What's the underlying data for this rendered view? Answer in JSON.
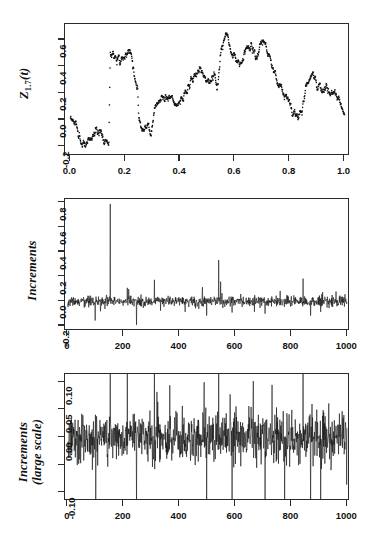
{
  "figure": {
    "background": "#ffffff",
    "ink": "#2b2b2b",
    "panel_count": 3
  },
  "chart_data": [
    {
      "type": "scatter",
      "panel": 1,
      "title": "",
      "xlabel": "",
      "ylabel": "Z_{1.7}(t)",
      "ylabel_parts": {
        "base": "Z",
        "subscript": "1.7",
        "arg": "(t)"
      },
      "xlim": [
        -0.02,
        1.02
      ],
      "ylim": [
        -0.27,
        0.72
      ],
      "xticks": [
        0.0,
        0.2,
        0.4,
        0.6,
        0.8,
        1.0
      ],
      "xticklabels": [
        "0.0",
        "0.2",
        "0.4",
        "0.6",
        "0.8",
        "1.0"
      ],
      "yticks": [
        -0.2,
        0.0,
        0.2,
        0.4,
        0.6
      ],
      "yticklabels": [
        "-0.2",
        "0.0",
        "0.2",
        "0.4",
        "0.6"
      ],
      "grid": false,
      "legend": null,
      "marker": "point",
      "marker_color": "#111111",
      "marker_size": 1.3,
      "n_points": 1000,
      "description": "Sample path of a 1.7-stable Levy-driven process Z_{1.7}(t) on t in [0,1]; rough jump-diffusion trajectory with visible upward jumps near t=0.15 and t=0.53 and a downward drift after t=0.72.",
      "path_anchors": {
        "t": [
          0.0,
          0.02,
          0.04,
          0.06,
          0.08,
          0.1,
          0.12,
          0.14,
          0.145,
          0.16,
          0.18,
          0.2,
          0.22,
          0.235,
          0.245,
          0.25,
          0.27,
          0.29,
          0.305,
          0.32,
          0.34,
          0.36,
          0.38,
          0.4,
          0.42,
          0.44,
          0.46,
          0.47,
          0.49,
          0.51,
          0.525,
          0.535,
          0.55,
          0.57,
          0.59,
          0.6,
          0.62,
          0.64,
          0.66,
          0.68,
          0.695,
          0.71,
          0.73,
          0.75,
          0.77,
          0.79,
          0.81,
          0.83,
          0.845,
          0.86,
          0.88,
          0.9,
          0.92,
          0.94,
          0.96,
          0.98,
          1.0
        ],
        "z": [
          0.02,
          -0.04,
          -0.17,
          -0.19,
          -0.15,
          -0.06,
          -0.11,
          -0.22,
          0.45,
          0.47,
          0.44,
          0.5,
          0.52,
          0.3,
          0.25,
          -0.02,
          -0.07,
          -0.1,
          0.02,
          0.14,
          0.18,
          0.14,
          0.16,
          0.12,
          0.23,
          0.32,
          0.39,
          0.41,
          0.33,
          0.3,
          0.37,
          0.25,
          0.53,
          0.63,
          0.55,
          0.5,
          0.41,
          0.52,
          0.55,
          0.46,
          0.6,
          0.56,
          0.42,
          0.29,
          0.24,
          0.17,
          0.11,
          0.02,
          0.08,
          0.22,
          0.35,
          0.26,
          0.19,
          0.24,
          0.22,
          0.13,
          0.01
        ]
      }
    },
    {
      "type": "line",
      "panel": 2,
      "title": "",
      "xlabel": "",
      "ylabel": "Increments",
      "xlim": [
        -10,
        1010
      ],
      "ylim": [
        -0.24,
        0.83
      ],
      "xticks": [
        0,
        200,
        400,
        600,
        800,
        1000
      ],
      "xticklabels": [
        "0",
        "200",
        "400",
        "600",
        "800",
        "1000"
      ],
      "yticks": [
        -0.2,
        0.0,
        0.2,
        0.4,
        0.6,
        0.8
      ],
      "yticklabels": [
        "-0.2",
        "0.0",
        "0.2",
        "0.4",
        "0.6",
        "0.8"
      ],
      "grid": false,
      "legend": null,
      "line_color": "#111111",
      "line_width": 0.6,
      "n_points": 1000,
      "noise_sd": 0.022,
      "description": "Increment series of the stable process; mostly small noise around zero with a dominant positive spike of 0.79 near index 152 and secondary spikes.",
      "spikes": [
        {
          "index": 98,
          "value": -0.155
        },
        {
          "index": 152,
          "value": 0.79
        },
        {
          "index": 213,
          "value": 0.11
        },
        {
          "index": 218,
          "value": 0.1
        },
        {
          "index": 246,
          "value": -0.19
        },
        {
          "index": 310,
          "value": 0.175
        },
        {
          "index": 332,
          "value": -0.075
        },
        {
          "index": 420,
          "value": -0.085
        },
        {
          "index": 482,
          "value": 0.115
        },
        {
          "index": 497,
          "value": -0.115
        },
        {
          "index": 540,
          "value": 0.335
        },
        {
          "index": 547,
          "value": 0.16
        },
        {
          "index": 588,
          "value": -0.09
        },
        {
          "index": 668,
          "value": -0.085
        },
        {
          "index": 706,
          "value": -0.1
        },
        {
          "index": 760,
          "value": 0.085
        },
        {
          "index": 842,
          "value": 0.185
        },
        {
          "index": 869,
          "value": -0.115
        },
        {
          "index": 905,
          "value": -0.085
        },
        {
          "index": 912,
          "value": 0.075
        }
      ]
    },
    {
      "type": "line",
      "panel": 3,
      "title": "",
      "xlabel": "",
      "ylabel": "Increments (large scale)",
      "ylabel_lines": [
        "Increments",
        "(large scale)"
      ],
      "xlim": [
        -10,
        1010
      ],
      "ylim": [
        -0.115,
        0.115
      ],
      "xticks": [
        0,
        200,
        400,
        600,
        800,
        1000
      ],
      "xticklabels": [
        "0",
        "200",
        "400",
        "600",
        "800",
        "1000"
      ],
      "yticks": [
        0.1,
        0.05,
        0.0,
        -0.05,
        -0.1
      ],
      "yticklabels": [
        "0.10",
        "0.05",
        "0.00",
        "",
        "-0.10"
      ],
      "grid": false,
      "legend": null,
      "line_color": "#111111",
      "line_width": 0.6,
      "n_points": 1000,
      "noise_sd": 0.021,
      "description": "Same increment series magnified; dense high-frequency noise band of roughly +/-0.04 with numerous excursions clipped at the +0.10 and -0.10 frame edges.",
      "clipped_spikes": [
        {
          "index": 100,
          "value": -0.115
        },
        {
          "index": 152,
          "value": 0.115
        },
        {
          "index": 213,
          "value": 0.115
        },
        {
          "index": 246,
          "value": -0.115
        },
        {
          "index": 310,
          "value": 0.115
        },
        {
          "index": 488,
          "value": 0.1
        },
        {
          "index": 497,
          "value": -0.115
        },
        {
          "index": 540,
          "value": 0.115
        },
        {
          "index": 588,
          "value": -0.115
        },
        {
          "index": 706,
          "value": -0.115
        },
        {
          "index": 842,
          "value": 0.115
        },
        {
          "index": 869,
          "value": -0.115
        },
        {
          "index": 905,
          "value": -0.115
        }
      ]
    }
  ]
}
